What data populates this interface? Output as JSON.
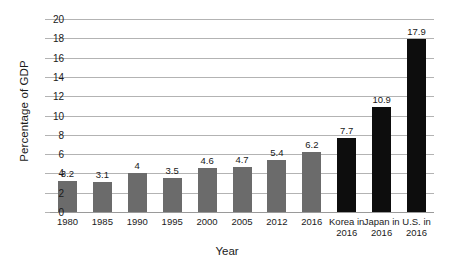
{
  "chart_data": {
    "type": "bar",
    "title": "",
    "xlabel": "Year",
    "ylabel": "Percentage of GDP",
    "ylim": [
      0,
      20
    ],
    "ytick_step": 2,
    "yticks": [
      "20",
      "18",
      "16",
      "14",
      "12",
      "10",
      "8",
      "6",
      "4",
      "2",
      "0"
    ],
    "grid": true,
    "legend": "none",
    "categories": [
      "1980",
      "1985",
      "1990",
      "1995",
      "2000",
      "2005",
      "2012",
      "2016",
      "Korea in 2016",
      "Japan in 2016",
      "U.S. in 2016"
    ],
    "values": [
      3.2,
      3.1,
      4,
      3.5,
      4.6,
      4.7,
      5.4,
      6.2,
      7.7,
      10.9,
      17.9
    ],
    "value_labels": [
      "3.2",
      "3.1",
      "4",
      "3.5",
      "4.6",
      "4.7",
      "5.4",
      "6.2",
      "7.7",
      "10.9",
      "17.9"
    ],
    "bar_colors": [
      "#6b6b6b",
      "#6b6b6b",
      "#6b6b6b",
      "#6b6b6b",
      "#6b6b6b",
      "#6b6b6b",
      "#6b6b6b",
      "#6b6b6b",
      "#0d0d0d",
      "#0d0d0d",
      "#0d0d0d"
    ],
    "category_lines": [
      [
        "1980"
      ],
      [
        "1985"
      ],
      [
        "1990"
      ],
      [
        "1995"
      ],
      [
        "2000"
      ],
      [
        "2005"
      ],
      [
        "2012"
      ],
      [
        "2016"
      ],
      [
        "Korea in",
        "2016"
      ],
      [
        "Japan in",
        "2016"
      ],
      [
        "U.S. in",
        "2016"
      ]
    ]
  },
  "colors": {
    "series_primary": "#6b6b6b",
    "series_highlight": "#0d0d0d",
    "gridline": "#b3b3b3",
    "text": "#1a1a1a",
    "background": "#ffffff"
  }
}
